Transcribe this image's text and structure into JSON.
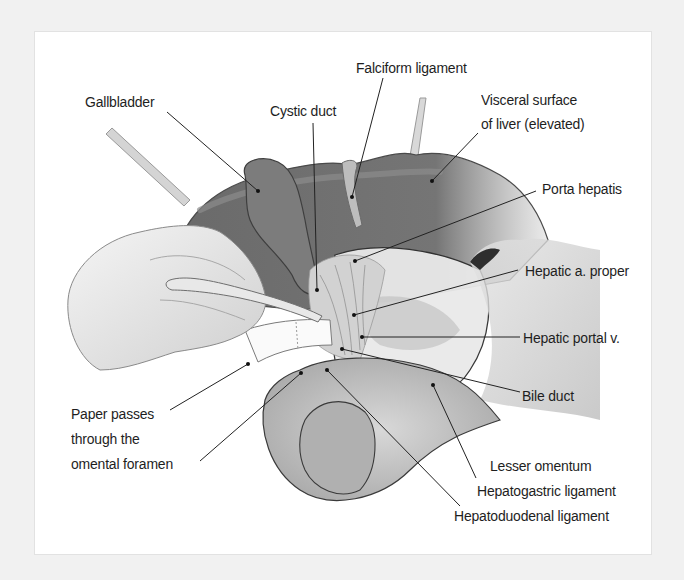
{
  "figure": {
    "style": "grayscale anatomical illustration",
    "colors": {
      "frame": "#f1f1f1",
      "panel": "#ffffff",
      "liver": "#6e6e6e",
      "text": "#1e1e1e",
      "leader": "#222222"
    }
  },
  "labels": {
    "gallbladder": "Gallbladder",
    "cystic_duct": "Cystic duct",
    "falciform_ligament": "Falciform ligament",
    "visceral_surface_1": "Visceral surface",
    "visceral_surface_2": "of liver (elevated)",
    "porta_hepatis": "Porta hepatis",
    "hepatic_a_proper": "Hepatic a. proper",
    "hepatic_portal_v": "Hepatic portal v.",
    "bile_duct": "Bile duct",
    "paper_1": "Paper passes",
    "paper_2": "through the",
    "paper_3": "omental foramen",
    "lesser_omentum": "Lesser omentum",
    "hepatogastric": "Hepatogastric ligament",
    "hepatoduodenal": "Hepatoduodenal ligament"
  }
}
